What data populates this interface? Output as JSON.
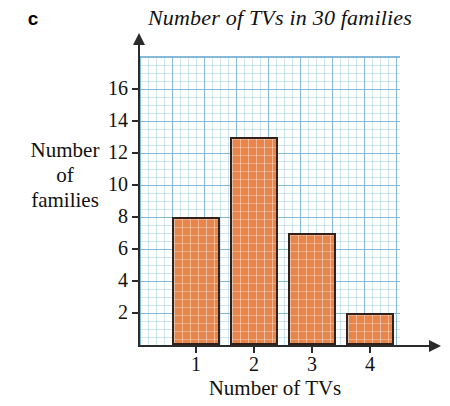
{
  "part_label": "c",
  "chart_data": {
    "type": "bar",
    "title": "Number of TVs in 30 families",
    "xlabel": "Number of TVs",
    "ylabel_lines": [
      "Number",
      "of",
      "families"
    ],
    "ylabel": "Number of families",
    "categories": [
      "1",
      "2",
      "3",
      "4"
    ],
    "values": [
      8,
      13,
      7,
      2
    ],
    "ytick_labels": [
      "2",
      "4",
      "6",
      "8",
      "10",
      "12",
      "14",
      "16"
    ],
    "ytick_values": [
      2,
      4,
      6,
      8,
      10,
      12,
      14,
      16
    ],
    "ylim": [
      0,
      17
    ],
    "xlim": [
      0,
      5
    ],
    "grid": true,
    "legend": "none",
    "colors": {
      "bar_fill": "#e8854a",
      "bar_edge": "#332018",
      "grid_major": "#78b2d6",
      "grid_minor": "#96c8e4",
      "axis": "#2b2b2b",
      "text": "#111111"
    }
  }
}
